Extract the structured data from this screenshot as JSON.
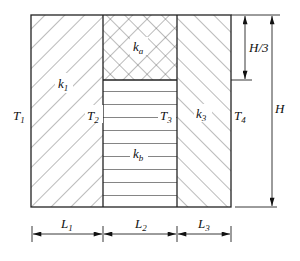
{
  "diagram": {
    "regions": {
      "k1": {
        "label": "k",
        "sub": "1",
        "hatch": "diagonal-forward"
      },
      "ka": {
        "label": "k",
        "sub": "a",
        "hatch": "cross"
      },
      "kb": {
        "label": "k",
        "sub": "b",
        "hatch": "horizontal"
      },
      "k3": {
        "label": "k",
        "sub": "3",
        "hatch": "diagonal-back"
      }
    },
    "temperatures": {
      "T1": {
        "label": "T",
        "sub": "1"
      },
      "T2": {
        "label": "T",
        "sub": "2"
      },
      "T3": {
        "label": "T",
        "sub": "3"
      },
      "T4": {
        "label": "T",
        "sub": "4"
      }
    },
    "dimensions": {
      "L1": {
        "label": "L",
        "sub": "1"
      },
      "L2": {
        "label": "L",
        "sub": "2"
      },
      "L3": {
        "label": "L",
        "sub": "3"
      },
      "H3": {
        "label": "H/3"
      },
      "H": {
        "label": "H"
      }
    },
    "colors": {
      "line": "#222222",
      "hatch": "#555555",
      "background": "#ffffff"
    }
  }
}
